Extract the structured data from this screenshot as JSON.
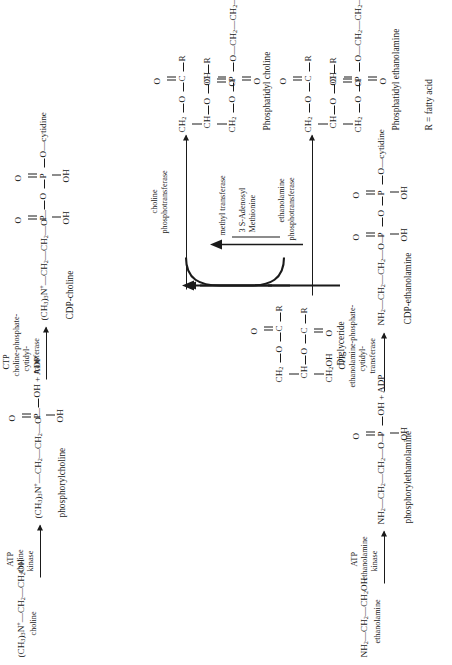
{
  "figure": {
    "orientation": "rotated-90-ccw",
    "footnote": "R = fatty acid"
  },
  "colors": {
    "ink": "#1a1a1a",
    "paper": "#ffffff"
  },
  "choline_branch": {
    "substrate": {
      "formula_html": "(CH<sub>3</sub>)<sub>3</sub>N<sup>+</sup>—CH<sub>2</sub>—CH<sub>2</sub>OH",
      "name": "choline"
    },
    "step1": {
      "cofactor": "ATP",
      "enzyme_line1": "choline",
      "enzyme_line2": "kinase",
      "product_backbone_html": "(CH<sub>3</sub>)<sub>3</sub>N<sup>+</sup>—CH<sub>2</sub>—CH<sub>2</sub>—O—",
      "p_atom": "P",
      "double_bond_o": "O",
      "right_group": "OH + ADP",
      "below_group": "OH",
      "product_name": "phosphorylcholine"
    },
    "step2": {
      "cofactor": "CTP",
      "enzyme_line1": "choline-phosphate-",
      "enzyme_line2": "cytidyl-",
      "enzyme_line3": "transferase",
      "product_backbone_html": "(CH<sub>3</sub>)<sub>3</sub>N<sup>+</sup>—CH<sub>2</sub>—CH<sub>2</sub>—O—",
      "p1": "P",
      "p1_o": "O",
      "p1_oh": "OH",
      "bridge_o": "O",
      "p2": "P",
      "p2_o": "O",
      "p2_oh": "OH",
      "terminal": "O—cytidine",
      "product_name": "CDP-choline"
    },
    "step3": {
      "enzyme_line1": "choline",
      "enzyme_line2": "phosphotransferase",
      "product_name": "Phosphatidyl choline",
      "c1_label": "CH<sub>2</sub>",
      "c2_label": "CH",
      "c3_label": "CH<sub>2</sub>",
      "ester1_o": "O",
      "ester1_c": "C",
      "ester1_dbl_o": "O",
      "ester1_r": "R",
      "ester2_o": "O",
      "ester2_c": "C",
      "ester2_dbl_o": "O",
      "ester2_r": "R",
      "phos_o": "O",
      "phos_p": "P",
      "phos_dbl_o": "O",
      "phos_oh": "OH",
      "headgroup_html": "O—CH<sub>2</sub>—CH<sub>2</sub>—N<sup>+</sup>(CH<sub>3</sub>)<sub>3</sub>"
    }
  },
  "ethanolamine_branch": {
    "substrate": {
      "formula_html": "NH<sub>2</sub>—CH<sub>2</sub>—CH<sub>2</sub>OH",
      "name": "ethanolamine"
    },
    "step1": {
      "cofactor": "ATP",
      "enzyme_line1": "ethanolamine",
      "enzyme_line2": "kinase",
      "product_backbone_html": "NH<sub>2</sub>—CH<sub>2</sub>—CH<sub>2</sub>—O—",
      "p_atom": "P",
      "double_bond_o": "O",
      "right_group": "OH + ADP",
      "below_group": "OH",
      "product_name": "phosphorylethanolamine"
    },
    "step2": {
      "cofactor": "CTP",
      "enzyme_line1": "ethanolamine-phosphate-",
      "enzyme_line2": "cytidyl-",
      "enzyme_line3": "transferase",
      "product_backbone_html": "NH<sub>2</sub>—CH<sub>2</sub>—CH<sub>2</sub>—O—",
      "p1": "P",
      "p1_o": "O",
      "p1_oh": "OH",
      "bridge_o": "O",
      "p2": "P",
      "p2_o": "O",
      "p2_oh": "OH",
      "terminal": "O—cytidine",
      "product_name": "CDP-ethanolamine"
    },
    "step3": {
      "enzyme_line1": "ethanolamine",
      "enzyme_line2": "phosphotransferase",
      "product_name": "Phosphatidyl ethanolamine",
      "c1_label": "CH<sub>2</sub>",
      "c2_label": "CH",
      "c3_label": "CH<sub>2</sub>",
      "ester1_o": "O",
      "ester1_c": "C",
      "ester1_dbl_o": "O",
      "ester1_r": "R",
      "ester2_o": "O",
      "ester2_c": "C",
      "ester2_dbl_o": "O",
      "ester2_r": "R",
      "phos_o": "O",
      "phos_p": "P",
      "phos_dbl_o": "O",
      "phos_oh": "OH",
      "headgroup_html": "O—CH<sub>2</sub>—CH<sub>2</sub>—NH<sub>2</sub>"
    }
  },
  "diglyceride": {
    "name": "Diglyceride",
    "c1_label": "CH<sub>2</sub>",
    "c2_label": "CH",
    "c3_label": "CH<sub>2</sub>OH",
    "ester1_o": "O",
    "ester1_c": "C",
    "ester1_dbl_o": "O",
    "ester1_r": "R",
    "ester2_o": "O",
    "ester2_c": "C",
    "ester2_dbl_o": "O",
    "ester2_r": "R"
  },
  "methylation": {
    "enzyme": "methyl transferase",
    "cofactor_line1": "3 S-Adenosyl",
    "cofactor_line2": "Methionine"
  }
}
